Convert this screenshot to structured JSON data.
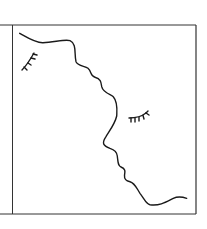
{
  "illustration": {
    "description": "Line drawing of two face profiles sharing one wavy contour line, each with a closed eye, inside a square frame",
    "colors": {
      "background": "#ffffff",
      "stroke": "#1a1a1a",
      "frame": "#333333"
    },
    "frame": {
      "left": 12,
      "top": 25,
      "right": 196,
      "bottom": 214
    },
    "profile_path": "M 19.7,33.3 C 28,38 36,43 43,42.7 C 55,42 66,39 70,40.7 C 77,44 74,53 76,61.7 C 78,66 85,66 88,68.3 C 92,72 90,76 95,77.3 C 101,79 101,82 101.7,86.7 C 103,93 112,95 113.3,96.7 C 118,102 117,110 116.7,116 C 115,124 108,133 106,136.7 C 101,144 104,146 110,148.3 C 115,150 117,152 117.3,156 C 118,162 118,166 121,167 C 126,169 125,172 124.5,175 C 124,180 127,181 130,181.7 C 135,183 137,189 140,193.3 C 145,200 146,204 150,204.7 C 160,206 166,202 173.3,198.3 C 178,196 183,197 186.7,198.3",
    "eyes": [
      {
        "name": "left-eye",
        "label": "closed eye (upper left)"
      },
      {
        "name": "right-eye",
        "label": "closed eye (right face)"
      }
    ]
  }
}
